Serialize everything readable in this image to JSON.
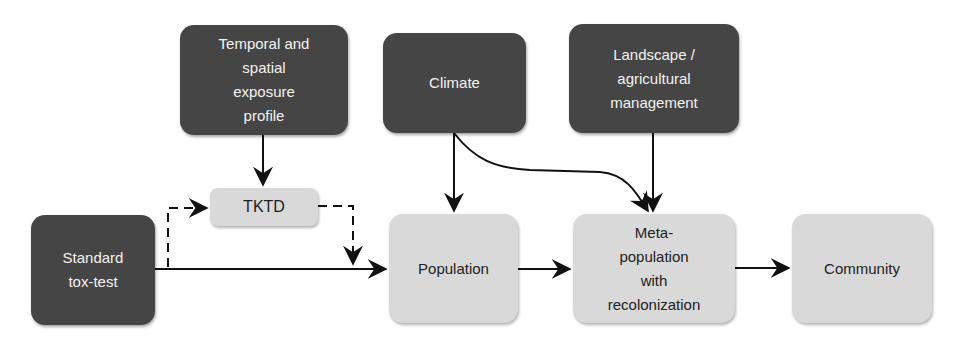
{
  "diagram": {
    "nodes": {
      "temporal": {
        "label": "Temporal and\nspatial\nexposure\nprofile",
        "style": "dark"
      },
      "climate": {
        "label": "Climate",
        "style": "dark"
      },
      "landscape": {
        "label": "Landscape /\nagricultural\nmanagement",
        "style": "dark"
      },
      "tktd": {
        "label": "TKTD",
        "style": "light"
      },
      "standard": {
        "label": "Standard\ntox-test",
        "style": "dark"
      },
      "population": {
        "label": "Population",
        "style": "light"
      },
      "metapop": {
        "label": "Meta-\npopulation\nwith\nrecolonization",
        "style": "light"
      },
      "community": {
        "label": "Community",
        "style": "light"
      }
    },
    "edges": [
      {
        "from": "temporal",
        "to": "tktd",
        "style": "solid"
      },
      {
        "from": "standard",
        "to": "tktd",
        "style": "dashed"
      },
      {
        "from": "tktd",
        "to": "population",
        "style": "dashed"
      },
      {
        "from": "standard",
        "to": "population",
        "style": "solid"
      },
      {
        "from": "climate",
        "to": "population",
        "style": "solid"
      },
      {
        "from": "climate",
        "to": "metapop",
        "style": "solid-curved"
      },
      {
        "from": "landscape",
        "to": "metapop",
        "style": "solid"
      },
      {
        "from": "population",
        "to": "metapop",
        "style": "solid"
      },
      {
        "from": "metapop",
        "to": "community",
        "style": "solid"
      }
    ],
    "colors": {
      "dark_box": "#454545",
      "light_box": "#d9d9d9",
      "arrow": "#111111"
    }
  }
}
